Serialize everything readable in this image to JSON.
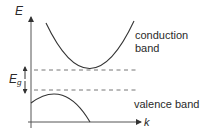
{
  "diagram": {
    "type": "band-structure",
    "axes": {
      "y_label": "E",
      "x_label": "k"
    },
    "gap_label": {
      "main": "E",
      "subscript": "g"
    },
    "bands": [
      {
        "name": "conduction",
        "label_line1": "conduction",
        "label_line2": "band"
      },
      {
        "name": "valence",
        "label": "valence band"
      }
    ],
    "colors": {
      "line": "#333333",
      "dashed": "#555555",
      "text": "#2a2a2a"
    }
  }
}
